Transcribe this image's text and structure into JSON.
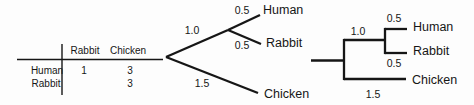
{
  "figure": {
    "background": "#fdfdfd",
    "ink_color": "#161616",
    "description_elements": [
      "distance-matrix-table",
      "slanted-phylogenetic-tree",
      "rectangular-phylogenetic-tree"
    ]
  },
  "distance_table": {
    "col_headers": [
      "Rabbit",
      "Chicken"
    ],
    "rows": [
      {
        "label": "Human",
        "values": [
          "1",
          "3"
        ]
      },
      {
        "label": "Rabbit",
        "values": [
          "",
          "3"
        ]
      }
    ]
  },
  "tree_diagonal": {
    "style": "slanted",
    "branch_lengths": {
      "internal": "1.0",
      "human": "0.5",
      "rabbit": "0.5",
      "chicken": "1.5"
    },
    "taxa": {
      "human": "Human",
      "rabbit": "Rabbit",
      "chicken": "Chicken"
    }
  },
  "tree_rectangular": {
    "style": "rectangular",
    "branch_lengths": {
      "internal": "1.0",
      "human": "0.5",
      "rabbit": "0.5",
      "chicken": "1.5"
    },
    "taxa": {
      "human": "Human",
      "rabbit": "Rabbit",
      "chicken": "Chicken"
    }
  }
}
